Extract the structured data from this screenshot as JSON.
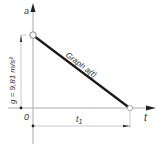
{
  "diagram": {
    "axes": {
      "y_label": "a",
      "x_label": "t",
      "origin_label": "0"
    },
    "graph_label": "Graph a(t)",
    "dimensions": {
      "vertical": "g = 9,81 m/s²",
      "horizontal": "t",
      "horizontal_subscript": "1"
    },
    "points": [
      {
        "name": "start",
        "t": 0,
        "a": "g"
      },
      {
        "name": "end",
        "t": "t1",
        "a": 0
      }
    ],
    "colors": {
      "line": "#1a1a1a",
      "axis": "#999999",
      "text": "#333333"
    }
  }
}
